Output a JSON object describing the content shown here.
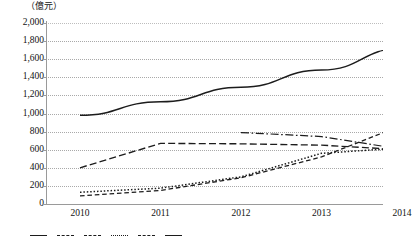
{
  "chart_data": {
    "type": "line",
    "title": "",
    "subtitle": "",
    "unit_label": "（億元）",
    "xlabel": "",
    "ylabel": "",
    "x": [
      "2010",
      "2011",
      "2012",
      "2013",
      "2014"
    ],
    "categories": [
      "2010",
      "2011",
      "2012",
      "2013",
      "2014"
    ],
    "ylim": [
      0,
      2000
    ],
    "ytick_step": 200,
    "yticks": [
      "2,000",
      "1,800",
      "1,600",
      "1,400",
      "1,200",
      "1,000",
      "800",
      "600",
      "400",
      "200",
      "0"
    ],
    "ytick_values": [
      2000,
      1800,
      1600,
      1400,
      1200,
      1000,
      800,
      600,
      400,
      200,
      0
    ],
    "grid": "horizontal-dotted",
    "legend_position": "bottom",
    "legend_clipped": true,
    "series": [
      {
        "name": "series-1",
        "style": "solid",
        "label": "",
        "values": [
          980,
          1130,
          1290,
          1480,
          1720
        ]
      },
      {
        "name": "series-2",
        "style": "long-dash",
        "label": "",
        "values": [
          400,
          670,
          665,
          650,
          600
        ]
      },
      {
        "name": "series-3",
        "style": "dash-dot",
        "label": "",
        "values": [
          null,
          null,
          790,
          745,
          605
        ]
      },
      {
        "name": "series-4",
        "style": "dotted",
        "label": "",
        "values": [
          130,
          175,
          300,
          560,
          620
        ]
      },
      {
        "name": "series-5",
        "style": "short-dash",
        "label": "",
        "values": [
          90,
          150,
          290,
          520,
          870
        ]
      }
    ]
  },
  "legend": {
    "items": [
      {
        "label": "",
        "style": "solid"
      },
      {
        "label": "",
        "style": "long-dash"
      },
      {
        "label": "",
        "style": "dash-dot"
      },
      {
        "label": "",
        "style": "dotted"
      },
      {
        "label": "",
        "style": "short-dash"
      },
      {
        "label": "",
        "style": "solid"
      }
    ]
  },
  "colors": {
    "line": "#1c1c1c",
    "grid": "#a9a9a9",
    "axis": "#9a9a9a",
    "text": "#111111",
    "background": "#ffffff"
  }
}
